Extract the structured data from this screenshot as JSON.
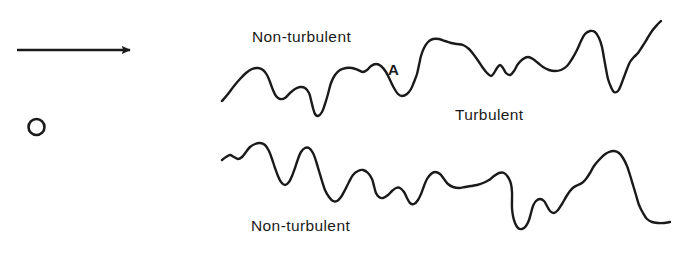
{
  "figure": {
    "background_color": "#ffffff",
    "ink_color": "#1a1a1a",
    "width": 681,
    "height": 253
  },
  "labels": {
    "non_turbulent_top": "Non-turbulent",
    "turbulent": "Turbulent",
    "non_turbulent_bottom": "Non-turbulent",
    "interface_point": "A"
  },
  "annotations": {
    "flow_arrow": {
      "icon": "arrow-right-icon",
      "x1": 17,
      "y1": 50,
      "x2": 136,
      "y2": 50,
      "stroke_width": 2.6
    },
    "marker_circle": {
      "icon": "circle-outline-icon",
      "cx": 36.5,
      "cy": 127,
      "r": 8,
      "stroke_width": 2.6
    }
  },
  "chart_data": {
    "type": "line",
    "xlabel": "",
    "ylabel": "",
    "grid": false,
    "legend": "none",
    "xlim": [
      0,
      681
    ],
    "ylim": [
      253,
      0
    ],
    "note": "Two irregular interface contours bounding a turbulent region; y measured downward in pixels.",
    "series": [
      {
        "name": "upper-interface",
        "label": "Upper turbulent/non-turbulent interface",
        "stroke_width": 2.4,
        "points": [
          [
            222,
            101
          ],
          [
            228,
            94
          ],
          [
            234,
            86
          ],
          [
            240,
            79
          ],
          [
            246,
            73
          ],
          [
            252,
            69
          ],
          [
            258,
            68
          ],
          [
            263,
            70
          ],
          [
            267,
            75
          ],
          [
            270,
            82
          ],
          [
            273,
            90
          ],
          [
            276,
            96
          ],
          [
            280,
            99
          ],
          [
            285,
            98
          ],
          [
            290,
            93
          ],
          [
            295,
            89
          ],
          [
            300,
            87
          ],
          [
            305,
            88
          ],
          [
            309,
            93
          ],
          [
            311,
            100
          ],
          [
            313,
            108
          ],
          [
            315,
            114
          ],
          [
            318,
            116
          ],
          [
            322,
            112
          ],
          [
            325,
            104
          ],
          [
            328,
            94
          ],
          [
            331,
            83
          ],
          [
            335,
            75
          ],
          [
            340,
            70
          ],
          [
            346,
            68
          ],
          [
            352,
            68
          ],
          [
            358,
            70
          ],
          [
            363,
            72
          ],
          [
            367,
            70
          ],
          [
            371,
            66
          ],
          [
            376,
            64
          ],
          [
            381,
            66
          ],
          [
            386,
            72
          ],
          [
            390,
            80
          ],
          [
            394,
            88
          ],
          [
            398,
            94
          ],
          [
            402,
            96
          ],
          [
            407,
            94
          ],
          [
            411,
            89
          ],
          [
            414,
            82
          ],
          [
            417,
            74
          ],
          [
            419,
            65
          ],
          [
            421,
            56
          ],
          [
            424,
            48
          ],
          [
            428,
            42
          ],
          [
            433,
            39
          ],
          [
            439,
            39
          ],
          [
            445,
            41
          ],
          [
            451,
            43
          ],
          [
            457,
            44
          ],
          [
            463,
            45
          ],
          [
            469,
            49
          ],
          [
            474,
            55
          ],
          [
            479,
            62
          ],
          [
            483,
            68
          ],
          [
            487,
            73
          ],
          [
            491,
            76
          ],
          [
            494,
            73
          ],
          [
            497,
            68
          ],
          [
            500,
            65
          ],
          [
            503,
            68
          ],
          [
            506,
            73
          ],
          [
            510,
            75
          ],
          [
            514,
            71
          ],
          [
            518,
            64
          ],
          [
            523,
            59
          ],
          [
            528,
            57
          ],
          [
            533,
            59
          ],
          [
            538,
            63
          ],
          [
            543,
            67
          ],
          [
            549,
            70
          ],
          [
            555,
            71
          ],
          [
            561,
            70
          ],
          [
            567,
            66
          ],
          [
            572,
            59
          ],
          [
            577,
            50
          ],
          [
            581,
            41
          ],
          [
            585,
            34
          ],
          [
            590,
            31
          ],
          [
            595,
            32
          ],
          [
            599,
            38
          ],
          [
            602,
            47
          ],
          [
            604,
            58
          ],
          [
            606,
            69
          ],
          [
            608,
            79
          ],
          [
            611,
            87
          ],
          [
            614,
            92
          ],
          [
            618,
            91
          ],
          [
            621,
            85
          ],
          [
            624,
            77
          ],
          [
            627,
            69
          ],
          [
            630,
            62
          ],
          [
            634,
            57
          ],
          [
            638,
            53
          ],
          [
            642,
            47
          ],
          [
            647,
            39
          ],
          [
            652,
            31
          ],
          [
            657,
            25
          ],
          [
            661,
            21
          ]
        ]
      },
      {
        "name": "lower-interface",
        "label": "Lower turbulent/non-turbulent interface",
        "stroke_width": 2.4,
        "points": [
          [
            222,
            160
          ],
          [
            226,
            157
          ],
          [
            230,
            155
          ],
          [
            234,
            157
          ],
          [
            238,
            159
          ],
          [
            242,
            157
          ],
          [
            246,
            152
          ],
          [
            250,
            147
          ],
          [
            255,
            144
          ],
          [
            260,
            143
          ],
          [
            265,
            145
          ],
          [
            269,
            151
          ],
          [
            272,
            159
          ],
          [
            275,
            168
          ],
          [
            278,
            176
          ],
          [
            281,
            182
          ],
          [
            285,
            185
          ],
          [
            289,
            182
          ],
          [
            292,
            176
          ],
          [
            295,
            168
          ],
          [
            298,
            159
          ],
          [
            301,
            152
          ],
          [
            305,
            148
          ],
          [
            309,
            148
          ],
          [
            313,
            153
          ],
          [
            316,
            161
          ],
          [
            319,
            171
          ],
          [
            322,
            181
          ],
          [
            325,
            190
          ],
          [
            329,
            197
          ],
          [
            333,
            201
          ],
          [
            337,
            201
          ],
          [
            341,
            197
          ],
          [
            345,
            190
          ],
          [
            349,
            182
          ],
          [
            353,
            175
          ],
          [
            358,
            171
          ],
          [
            363,
            170
          ],
          [
            368,
            173
          ],
          [
            372,
            179
          ],
          [
            374,
            186
          ],
          [
            376,
            193
          ],
          [
            379,
            197
          ],
          [
            383,
            198
          ],
          [
            388,
            195
          ],
          [
            392,
            191
          ],
          [
            396,
            188
          ],
          [
            400,
            188
          ],
          [
            404,
            192
          ],
          [
            407,
            198
          ],
          [
            410,
            203
          ],
          [
            414,
            204
          ],
          [
            418,
            200
          ],
          [
            421,
            194
          ],
          [
            424,
            186
          ],
          [
            427,
            179
          ],
          [
            431,
            174
          ],
          [
            435,
            172
          ],
          [
            440,
            174
          ],
          [
            444,
            179
          ],
          [
            448,
            184
          ],
          [
            453,
            187
          ],
          [
            459,
            188
          ],
          [
            465,
            187
          ],
          [
            471,
            186
          ],
          [
            477,
            185
          ],
          [
            483,
            183
          ],
          [
            489,
            180
          ],
          [
            494,
            176
          ],
          [
            499,
            173
          ],
          [
            504,
            173
          ],
          [
            508,
            177
          ],
          [
            511,
            184
          ],
          [
            512,
            192
          ],
          [
            512,
            200
          ],
          [
            512,
            208
          ],
          [
            513,
            216
          ],
          [
            515,
            223
          ],
          [
            518,
            228
          ],
          [
            522,
            229
          ],
          [
            526,
            226
          ],
          [
            529,
            220
          ],
          [
            531,
            213
          ],
          [
            533,
            206
          ],
          [
            536,
            201
          ],
          [
            540,
            199
          ],
          [
            544,
            201
          ],
          [
            547,
            206
          ],
          [
            550,
            211
          ],
          [
            554,
            213
          ],
          [
            558,
            210
          ],
          [
            562,
            204
          ],
          [
            566,
            197
          ],
          [
            570,
            191
          ],
          [
            574,
            187
          ],
          [
            578,
            185
          ],
          [
            582,
            183
          ],
          [
            586,
            179
          ],
          [
            590,
            173
          ],
          [
            594,
            166
          ],
          [
            599,
            160
          ],
          [
            604,
            155
          ],
          [
            609,
            152
          ],
          [
            614,
            151
          ],
          [
            619,
            153
          ],
          [
            623,
            158
          ],
          [
            627,
            166
          ],
          [
            630,
            175
          ],
          [
            633,
            185
          ],
          [
            636,
            195
          ],
          [
            639,
            205
          ],
          [
            643,
            213
          ],
          [
            647,
            219
          ],
          [
            652,
            222
          ],
          [
            658,
            223
          ],
          [
            664,
            223
          ],
          [
            670,
            222
          ]
        ]
      }
    ]
  }
}
